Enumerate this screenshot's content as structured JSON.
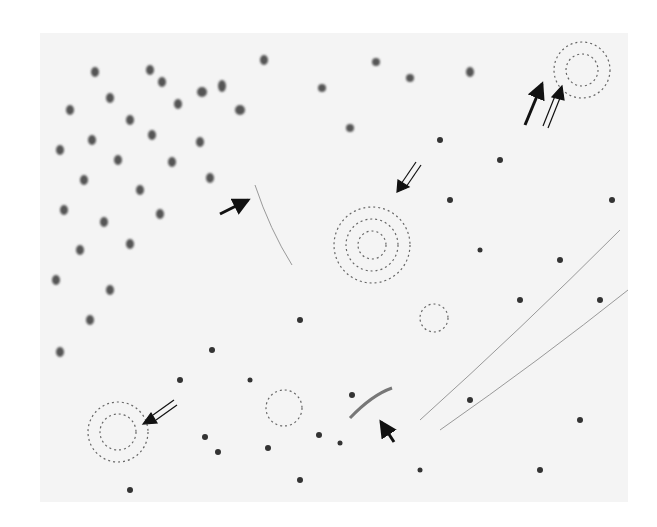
{
  "image": {
    "description": "Grayscale histological micrograph of brain tissue showing neuronal nuclei, fibrillary plaques and elongated cells",
    "bounds": {
      "x": 40,
      "y": 33,
      "width": 588,
      "height": 469
    },
    "background_color": "#f4f4f4",
    "nucleus_color": "#3a3a3a"
  },
  "annotations": {
    "solid_arrows": [
      {
        "tip": [
          253,
          198
        ],
        "tail": [
          220,
          214
        ]
      },
      {
        "tip": [
          378,
          418
        ],
        "tail": [
          394,
          442
        ]
      },
      {
        "tip": [
          544,
          78
        ],
        "tail": [
          525,
          125
        ]
      }
    ],
    "double_line_arrows": [
      {
        "tip": [
          397,
          192
        ],
        "tail": [
          418,
          162
        ]
      },
      {
        "tip": [
          143,
          424
        ],
        "tail": [
          176,
          403
        ]
      },
      {
        "tip": [
          562,
          86
        ],
        "tail": [
          545,
          126
        ]
      }
    ]
  },
  "plaques": [
    {
      "cx": 372,
      "cy": 245,
      "r": 38
    },
    {
      "cx": 118,
      "cy": 432,
      "r": 30
    },
    {
      "cx": 582,
      "cy": 70,
      "r": 28
    },
    {
      "cx": 284,
      "cy": 408,
      "r": 18
    },
    {
      "cx": 434,
      "cy": 318,
      "r": 14
    }
  ]
}
